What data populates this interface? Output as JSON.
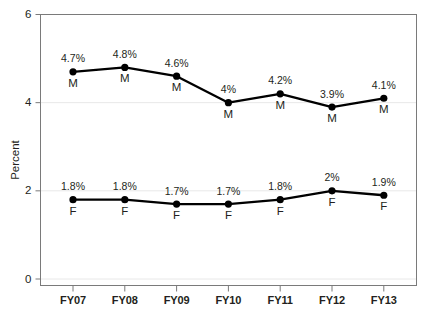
{
  "chart_data": {
    "type": "line",
    "title": "",
    "xlabel": "",
    "ylabel": "Percent",
    "categories": [
      "FY07",
      "FY08",
      "FY09",
      "FY10",
      "FY11",
      "FY12",
      "FY13"
    ],
    "ylim": [
      0,
      6
    ],
    "yticks": [
      0,
      2,
      4,
      6
    ],
    "ytick_labels": [
      "0",
      "2",
      "4",
      "6"
    ],
    "grid": true,
    "legend": "none",
    "series": [
      {
        "name": "M",
        "point_label": "M",
        "color": "#000000",
        "values": [
          4.7,
          4.8,
          4.6,
          4.0,
          4.2,
          3.9,
          4.1
        ],
        "data_labels": [
          "4.7%",
          "4.8%",
          "4.6%",
          "4%",
          "4.2%",
          "3.9%",
          "4.1%"
        ]
      },
      {
        "name": "F",
        "point_label": "F",
        "color": "#000000",
        "values": [
          1.8,
          1.8,
          1.7,
          1.7,
          1.8,
          2.0,
          1.9
        ],
        "data_labels": [
          "1.8%",
          "1.8%",
          "1.7%",
          "1.7%",
          "1.8%",
          "2%",
          "1.9%"
        ]
      }
    ]
  },
  "axes": {
    "frame_color": "#7a7a7a",
    "grid_color": "#e8e8e8",
    "text_color": "#231f20"
  }
}
